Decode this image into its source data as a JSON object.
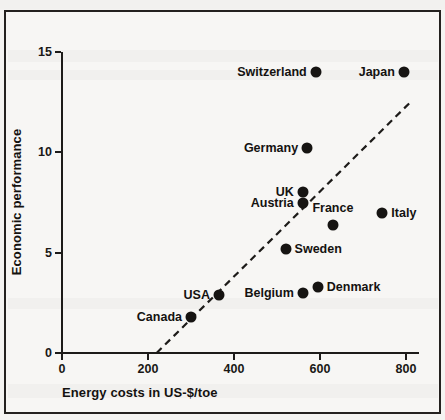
{
  "figure": {
    "background_color": "#f7f6f4",
    "border_color": "#24211f",
    "marker_color": "#161412",
    "text_color": "#141210",
    "top_bleed_text": "Energy costs and economic performance"
  },
  "chart_data": {
    "type": "scatter",
    "title": "",
    "xlabel": "Energy costs in US-$/toe",
    "ylabel": "Economic performance",
    "xlim": [
      0,
      840
    ],
    "ylim": [
      0,
      15.5
    ],
    "xticks": [
      0,
      200,
      400,
      600,
      800
    ],
    "xtick_labels": [
      "0",
      "200",
      "400",
      "600",
      "800"
    ],
    "yticks": [
      0,
      5,
      10,
      15
    ],
    "ytick_labels": [
      "0",
      "5",
      "10",
      "15"
    ],
    "grid": false,
    "legend": null,
    "points": [
      {
        "label": "Switzerland",
        "x": 590,
        "y": 14.0,
        "label_side": "left"
      },
      {
        "label": "Japan",
        "x": 795,
        "y": 14.0,
        "label_side": "left"
      },
      {
        "label": "Germany",
        "x": 570,
        "y": 10.2,
        "label_side": "left"
      },
      {
        "label": "UK",
        "x": 560,
        "y": 8.0,
        "label_side": "left"
      },
      {
        "label": "Austria",
        "x": 560,
        "y": 7.5,
        "label_side": "left"
      },
      {
        "label": "Italy",
        "x": 745,
        "y": 7.0,
        "label_side": "right"
      },
      {
        "label": "France",
        "x": 630,
        "y": 6.4,
        "label_side": "above"
      },
      {
        "label": "Sweden",
        "x": 520,
        "y": 5.2,
        "label_side": "right"
      },
      {
        "label": "Denmark",
        "x": 595,
        "y": 3.3,
        "label_side": "right"
      },
      {
        "label": "Belgium",
        "x": 560,
        "y": 3.0,
        "label_side": "left"
      },
      {
        "label": "USA",
        "x": 365,
        "y": 2.9,
        "label_side": "left"
      },
      {
        "label": "Canada",
        "x": 300,
        "y": 1.8,
        "label_side": "left"
      }
    ],
    "trendline": {
      "style": "dashed",
      "x_start": 220,
      "y_start": 0,
      "x_end": 815,
      "y_end": 12.6
    },
    "annotations": []
  }
}
